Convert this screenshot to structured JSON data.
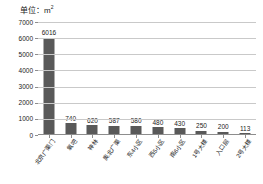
{
  "chart_data": {
    "type": "bar",
    "title": "",
    "unit_label": "单位：",
    "unit_value": "m",
    "unit_superscript": "2",
    "xlabel": "",
    "ylabel": "",
    "ylim": [
      0,
      7000
    ],
    "grid": true,
    "legend": "none",
    "ytick_labels": [
      "0",
      "1000",
      "2000",
      "3000",
      "4000",
      "5000",
      "6000",
      "7000"
    ],
    "ytick_values": [
      0,
      1000,
      2000,
      3000,
      4000,
      5000,
      6000,
      7000
    ],
    "categories": [
      "北京广渠门",
      "氧吧",
      "神林",
      "奥北广渠",
      "东4小区",
      "西5小区",
      "南6小区",
      "1号大楼",
      "入口层",
      "2号大楼"
    ],
    "values": [
      6016,
      740,
      620,
      587,
      580,
      480,
      430,
      250,
      200,
      113
    ],
    "value_labels": [
      "6016",
      "740",
      "620",
      "587",
      "580",
      "480",
      "430",
      "250",
      "200",
      "113"
    ],
    "bar_color": "#595959",
    "grid_color": "#c9c9c9",
    "axis_color": "#8d8d8d",
    "background": "#ffffff"
  }
}
